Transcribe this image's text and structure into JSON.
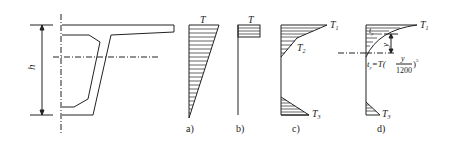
{
  "figure": {
    "section_label": "h",
    "panels": [
      {
        "id": "a",
        "caption": "a)",
        "top_label": "T"
      },
      {
        "id": "b",
        "caption": "b)",
        "top_label": "T"
      },
      {
        "id": "c",
        "caption": "c)",
        "labels": [
          "T1",
          "T2",
          "T3"
        ]
      },
      {
        "id": "d",
        "caption": "d)",
        "labels": [
          "T1",
          "ty",
          "y",
          "T3"
        ],
        "formula": "ty = T (y / 1200)^5"
      }
    ],
    "colors": {
      "stroke": "#222222",
      "background": "#ffffff"
    }
  }
}
